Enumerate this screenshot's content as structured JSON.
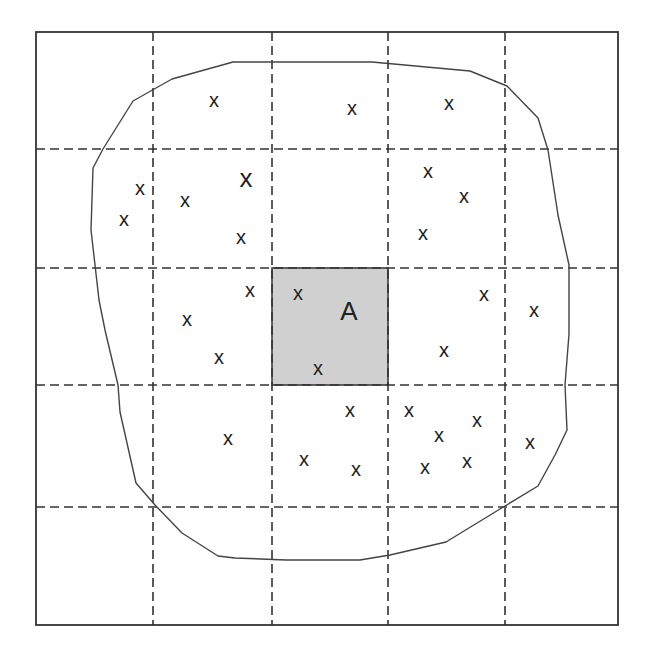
{
  "diagram": {
    "type": "quadrat-sampling-grid",
    "frame": {
      "left": 36,
      "top": 32,
      "right": 618,
      "bottom": 625,
      "stroke": "#333333"
    },
    "grid": {
      "rows": 5,
      "cols": 5,
      "vlines": [
        153,
        272,
        388,
        505
      ],
      "hlines": [
        149,
        268,
        385,
        507
      ],
      "dash": "9,5",
      "stroke": "#333333"
    },
    "highlight_cell": {
      "label": "A",
      "x": 272,
      "y": 268,
      "w": 116,
      "h": 117,
      "fill": "#d0d0d0",
      "label_x": 349,
      "label_y": 320
    },
    "boundary": {
      "stroke": "#444444",
      "points": [
        [
          233,
          62
        ],
        [
          372,
          62
        ],
        [
          470,
          71
        ],
        [
          507,
          86
        ],
        [
          538,
          118
        ],
        [
          548,
          150
        ],
        [
          558,
          215
        ],
        [
          569,
          265
        ],
        [
          569,
          334
        ],
        [
          565,
          385
        ],
        [
          567,
          430
        ],
        [
          555,
          455
        ],
        [
          538,
          486
        ],
        [
          500,
          509
        ],
        [
          446,
          542
        ],
        [
          390,
          555
        ],
        [
          360,
          560
        ],
        [
          286,
          560
        ],
        [
          235,
          558
        ],
        [
          218,
          556
        ],
        [
          182,
          533
        ],
        [
          155,
          505
        ],
        [
          136,
          483
        ],
        [
          120,
          412
        ],
        [
          118,
          385
        ],
        [
          105,
          330
        ],
        [
          99,
          300
        ],
        [
          91,
          230
        ],
        [
          93,
          168
        ],
        [
          103,
          149
        ],
        [
          133,
          101
        ],
        [
          172,
          79
        ]
      ]
    },
    "points_marker": "x",
    "points": [
      {
        "x": 214,
        "y": 100,
        "size": 20
      },
      {
        "x": 352,
        "y": 108,
        "size": 20
      },
      {
        "x": 449,
        "y": 103,
        "size": 20
      },
      {
        "x": 140,
        "y": 188,
        "size": 20
      },
      {
        "x": 124,
        "y": 219,
        "size": 20
      },
      {
        "x": 185,
        "y": 200,
        "size": 20
      },
      {
        "x": 246,
        "y": 178,
        "size": 26
      },
      {
        "x": 241,
        "y": 237,
        "size": 20
      },
      {
        "x": 428,
        "y": 171,
        "size": 20
      },
      {
        "x": 464,
        "y": 196,
        "size": 20
      },
      {
        "x": 423,
        "y": 233,
        "size": 20
      },
      {
        "x": 250,
        "y": 290,
        "size": 20
      },
      {
        "x": 187,
        "y": 319,
        "size": 20
      },
      {
        "x": 219,
        "y": 357,
        "size": 20
      },
      {
        "x": 298,
        "y": 293,
        "size": 20
      },
      {
        "x": 318,
        "y": 368,
        "size": 20
      },
      {
        "x": 484,
        "y": 294,
        "size": 20
      },
      {
        "x": 534,
        "y": 310,
        "size": 20
      },
      {
        "x": 444,
        "y": 350,
        "size": 20
      },
      {
        "x": 350,
        "y": 410,
        "size": 20
      },
      {
        "x": 409,
        "y": 410,
        "size": 20
      },
      {
        "x": 477,
        "y": 420,
        "size": 20
      },
      {
        "x": 439,
        "y": 435,
        "size": 20
      },
      {
        "x": 530,
        "y": 442,
        "size": 20
      },
      {
        "x": 228,
        "y": 438,
        "size": 20
      },
      {
        "x": 304,
        "y": 459,
        "size": 20
      },
      {
        "x": 356,
        "y": 469,
        "size": 20
      },
      {
        "x": 425,
        "y": 467,
        "size": 20
      },
      {
        "x": 467,
        "y": 461,
        "size": 20
      }
    ]
  }
}
